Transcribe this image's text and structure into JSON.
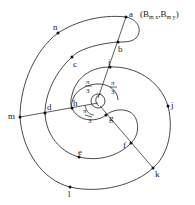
{
  "diagram": {
    "title": "",
    "points": [
      {
        "id": "a",
        "label": "a"
      },
      {
        "id": "b",
        "label": "b"
      },
      {
        "id": "c",
        "label": "c"
      },
      {
        "id": "d",
        "label": "d"
      },
      {
        "id": "e",
        "label": "e"
      },
      {
        "id": "f",
        "label": "f"
      },
      {
        "id": "g",
        "label": "g"
      },
      {
        "id": "h",
        "label": "h"
      },
      {
        "id": "i",
        "label": "i"
      },
      {
        "id": "j",
        "label": "j"
      },
      {
        "id": "k",
        "label": "k"
      },
      {
        "id": "l",
        "label": "l"
      },
      {
        "id": "m",
        "label": "m"
      },
      {
        "id": "n",
        "label": "n"
      }
    ],
    "annotation_a": {
      "open": "(",
      "B1": "B",
      "sub1": "m x",
      "comma": ",",
      "B2": "B",
      "sub2": "m y",
      "close": ")"
    },
    "angles": [
      {
        "numerator": "π",
        "denominator": "3"
      },
      {
        "numerator": "π",
        "denominator": "3"
      },
      {
        "numerator": "π",
        "denominator": "3"
      }
    ],
    "rays": [
      {
        "from": "center",
        "through": [
          "i",
          "b",
          "a"
        ]
      },
      {
        "from": "center",
        "through": [
          "h",
          "d",
          "m"
        ]
      },
      {
        "from": "center",
        "through": [
          "g",
          "f",
          "k"
        ]
      }
    ],
    "colors": {
      "stroke": "#333333",
      "point": "#111111"
    }
  }
}
